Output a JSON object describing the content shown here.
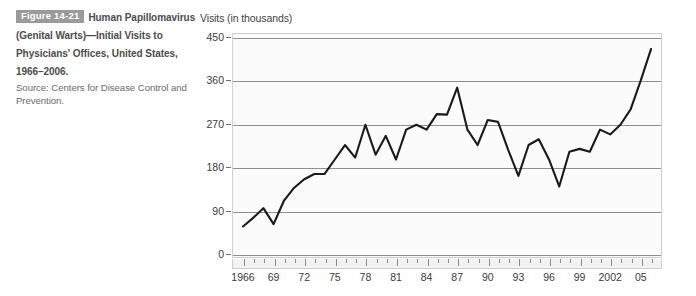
{
  "caption": {
    "figure_number": "Figure 14-21",
    "title": "Human Papillomavirus (Genital Warts)—Initial Visits to Physicians' Offices, United States, 1966–2006.",
    "source": "Source: Centers for Disease Control and Prevention."
  },
  "colors": {
    "badge_background": "#9a9a9a",
    "badge_text": "#ffffff",
    "caption_title": "#4c4c4c",
    "caption_source": "#6a6a6a",
    "plot_background": "#fbfbfb",
    "gridline": "#8f8f8f",
    "series_line": "#1a1a1a",
    "axis_text": "#3a3a3a"
  },
  "chart_data": {
    "type": "line",
    "title": "",
    "xlabel": "",
    "ylabel": "Visits (in thousands)",
    "ylim": [
      0,
      450
    ],
    "yticks": [
      0,
      90,
      180,
      270,
      360,
      450
    ],
    "xlim": [
      1966,
      2006
    ],
    "grid": true,
    "legend": "none",
    "x_tick_labels": [
      "1966",
      "69",
      "72",
      "75",
      "78",
      "81",
      "84",
      "87",
      "90",
      "93",
      "96",
      "99",
      "2002",
      "05"
    ],
    "x_tick_years": [
      1966,
      1969,
      1972,
      1975,
      1978,
      1981,
      1984,
      1987,
      1990,
      1993,
      1996,
      1999,
      2002,
      2005
    ],
    "x": [
      1966,
      1967,
      1968,
      1969,
      1970,
      1971,
      1972,
      1973,
      1974,
      1975,
      1976,
      1977,
      1978,
      1979,
      1980,
      1981,
      1982,
      1983,
      1984,
      1985,
      1986,
      1987,
      1988,
      1989,
      1990,
      1991,
      1992,
      1993,
      1994,
      1995,
      1996,
      1997,
      1998,
      1999,
      2000,
      2001,
      2002,
      2003,
      2004,
      2005,
      2006
    ],
    "values": [
      57,
      75,
      95,
      62,
      110,
      137,
      155,
      166,
      166,
      196,
      226,
      200,
      268,
      206,
      245,
      196,
      258,
      268,
      258,
      290,
      289,
      345,
      258,
      226,
      278,
      274,
      216,
      162,
      226,
      238,
      196,
      140,
      212,
      218,
      212,
      258,
      248,
      268,
      300,
      360,
      425
    ],
    "series": [
      {
        "name": "Initial visits to physicians' offices (thousands)",
        "values": [
          57,
          75,
          95,
          62,
          110,
          137,
          155,
          166,
          166,
          196,
          226,
          200,
          268,
          206,
          245,
          196,
          258,
          268,
          258,
          290,
          289,
          345,
          258,
          226,
          278,
          274,
          216,
          162,
          226,
          238,
          196,
          140,
          212,
          218,
          212,
          258,
          248,
          268,
          300,
          360,
          425
        ]
      }
    ]
  }
}
